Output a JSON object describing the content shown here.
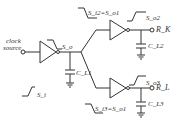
{
  "diagram": {
    "type": "clock-tree-schematic",
    "source_label_line1": "clock",
    "source_label_line2": "source",
    "input_waveform": "S_i",
    "buffer1_output_waveform": "S_o",
    "cap1": "C_L1",
    "branch_top": {
      "input_waveform": "S_i2=S_o1",
      "output_waveform": "S_o2",
      "cap": "C_L2",
      "load": "R_K"
    },
    "branch_bottom": {
      "input_waveform": "S_i3=S_o1",
      "output_waveform": "S_o3",
      "cap": "C_L3",
      "load": "R_L"
    }
  }
}
